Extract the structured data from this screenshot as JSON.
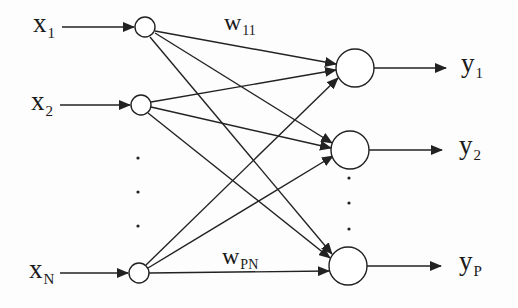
{
  "diagram": {
    "type": "single-layer neural network",
    "colors": {
      "stroke": "#222222",
      "background": "#fdfdfd"
    },
    "inputs": [
      {
        "id": "x1",
        "base": "x",
        "sub": "1",
        "cx": 145,
        "cy": 27
      },
      {
        "id": "x2",
        "base": "x",
        "sub": "2",
        "cx": 141,
        "cy": 105
      },
      {
        "id": "xN",
        "base": "x",
        "sub": "N",
        "cx": 139,
        "cy": 273
      }
    ],
    "outputs": [
      {
        "id": "y1",
        "base": "y",
        "sub": "1",
        "cx": 355,
        "cy": 68
      },
      {
        "id": "y2",
        "base": "y",
        "sub": "2",
        "cx": 350,
        "cy": 150
      },
      {
        "id": "yP",
        "base": "y",
        "sub": "P",
        "cx": 348,
        "cy": 266
      }
    ],
    "weights": [
      {
        "id": "w11",
        "base": "w",
        "sub": "11"
      },
      {
        "id": "wPN",
        "base": "w",
        "sub": "PN"
      }
    ],
    "ellipsis": {
      "input_dots": 3,
      "output_dots": 3
    }
  }
}
